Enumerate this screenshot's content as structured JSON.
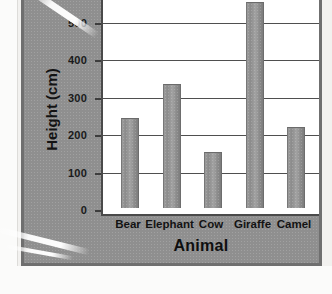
{
  "chart_data": {
    "type": "bar",
    "title": "",
    "xlabel": "Animal",
    "ylabel": "Height (cm)",
    "categories": [
      "Bear",
      "Elephant",
      "Cow",
      "Giraffe",
      "Camel",
      "Horse"
    ],
    "values": [
      240,
      330,
      150,
      550,
      215,
      160
    ],
    "ylim": [
      0,
      550
    ],
    "yticks": [
      0,
      100,
      200,
      300,
      400,
      500
    ],
    "ytick_labels": [
      "0",
      "100",
      "200",
      "300",
      "400",
      "500"
    ],
    "grid": true,
    "grid_axis": "y",
    "legend": false,
    "bar_color": "#999999",
    "panel_color": "#8f8f8f",
    "plot_background": "#ffffff",
    "axis_color": "#4a4a4a"
  },
  "axis": {
    "y_title": "Height (cm)",
    "x_title": "Animal",
    "y_labels": [
      "500",
      "400",
      "300",
      "200",
      "100",
      "0"
    ],
    "x_labels": [
      "Bear",
      "Elephant",
      "Cow",
      "Giraffe",
      "Camel",
      "Horse"
    ]
  }
}
